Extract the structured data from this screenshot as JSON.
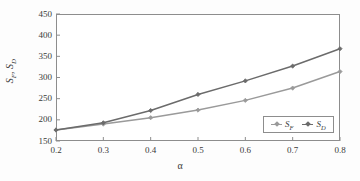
{
  "chart_data": {
    "type": "line",
    "title": "",
    "xlabel": "α",
    "ylabel": "S_F, S_D",
    "x": [
      0.2,
      0.3,
      0.4,
      0.5,
      0.6,
      0.7,
      0.8
    ],
    "xtick_labels": [
      "0.2",
      "0.3",
      "0.4",
      "0.5",
      "0.6",
      "0.7",
      "0.8"
    ],
    "xlim": [
      0.2,
      0.8
    ],
    "ylim": [
      150,
      450
    ],
    "ytick_labels": [
      "450",
      "400",
      "350",
      "300",
      "250",
      "200",
      "150"
    ],
    "ytick_values": [
      450,
      400,
      350,
      300,
      250,
      200,
      150
    ],
    "grid": false,
    "legend_position": "bottom-right",
    "series": [
      {
        "name": "S_F",
        "legend_label": "S",
        "legend_sub": "F",
        "color": "#9a9a9a",
        "marker": "diamond",
        "values": [
          176,
          190,
          205,
          223,
          246,
          275,
          314
        ]
      },
      {
        "name": "S_D",
        "legend_label": "S",
        "legend_sub": "D",
        "color": "#6b6b6b",
        "marker": "diamond",
        "values": [
          176,
          193,
          222,
          260,
          292,
          327,
          368
        ]
      }
    ]
  },
  "axes": {
    "y_title_main": "S",
    "y_title_sub1": "F",
    "y_title_sep": ", ",
    "y_title_main2": "S",
    "y_title_sub2": "D",
    "x_title": "α"
  },
  "colors": {
    "frame": "#8d8d8d",
    "background": "#ffffff",
    "text": "#3a3a3a",
    "series_sf": "#9a9a9a",
    "series_sd": "#6b6b6b"
  }
}
